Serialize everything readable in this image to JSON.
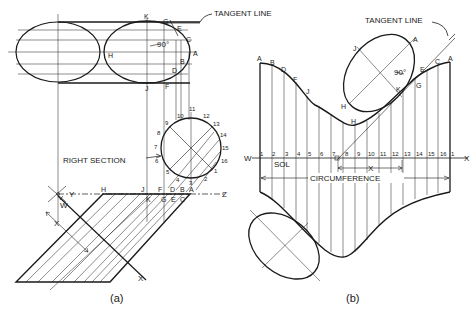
{
  "figure": {
    "panel_a": {
      "caption": "(a)",
      "tangent_line_label": "TANGENT LINE",
      "angle_label": "90°",
      "right_section_label": "RIGHT SECTION",
      "ellipse_points": [
        "K",
        "G",
        "E",
        "C",
        "A",
        "B",
        "D",
        "F",
        "J",
        "H"
      ],
      "circle_numbers": [
        "1",
        "2",
        "3",
        "4",
        "5",
        "6",
        "7",
        "8",
        "9",
        "10",
        "11",
        "12",
        "13",
        "14",
        "15",
        "16"
      ],
      "edge_labels_top": [
        "J",
        "F",
        "D",
        "B",
        "A"
      ],
      "edge_labels_bottom": [
        "K",
        "G",
        "E",
        "C"
      ],
      "axis_labels": {
        "y": "Y",
        "z": "Z",
        "h": "H",
        "w": "W",
        "x_dim": "X",
        "x_axis": "X"
      }
    },
    "panel_b": {
      "caption": "(b)",
      "tangent_line_label": "TANGENT LINE",
      "angle_label": "90°",
      "sol_label": "SOL",
      "circumference_label": "CIRCUMFERENCE",
      "axis_w": "W",
      "axis_x": "X",
      "x_dim": "X",
      "top_curve_labels": [
        "A",
        "B",
        "D",
        "F",
        "J",
        "H",
        "K",
        "G",
        "E",
        "C",
        "A"
      ],
      "ellipse_labels": {
        "j": "J",
        "a": "A",
        "h": "H",
        "k": "K",
        "g": "G"
      },
      "stretchout_numbers": [
        "1",
        "2",
        "3",
        "4",
        "5",
        "6",
        "7",
        "8",
        "9",
        "10",
        "11",
        "12",
        "13",
        "14",
        "15",
        "16",
        "1"
      ]
    }
  }
}
